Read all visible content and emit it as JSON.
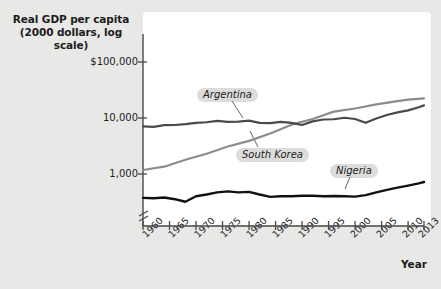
{
  "chart_data": {
    "type": "line",
    "title": "Real GDP per capita (2000 dollars, log scale)",
    "title_line1": "Real GDP per capita",
    "title_line2": "(2000 dollars, log scale)",
    "xlabel": "Year",
    "ylabel": "",
    "log_scale": true,
    "y_axis_break": true,
    "grid": false,
    "legend_position": "inline-callouts",
    "ytick_labels": [
      "$100,000",
      "10,000",
      "1,000"
    ],
    "ytick_values": [
      100000,
      10000,
      1000
    ],
    "ylim": [
      300,
      200000
    ],
    "xtick_labels": [
      "1960",
      "1965",
      "1970",
      "1975",
      "1980",
      "1985",
      "1990",
      "1995",
      "2000",
      "2005",
      "2010",
      "2013"
    ],
    "xtick_values": [
      1960,
      1965,
      1970,
      1975,
      1980,
      1985,
      1990,
      1995,
      2000,
      2005,
      2010,
      2013
    ],
    "xlim": [
      1960,
      2013
    ],
    "colors": {
      "argentina": "#4a4a4a",
      "south_korea": "#8c8c8c",
      "nigeria": "#111111",
      "panel": "#ffffff",
      "background": "#e8e8e6",
      "axis": "#4a4a4a",
      "callout_bg": "#dcdcda"
    },
    "series": [
      {
        "name": "Argentina",
        "color": "#4a4a4a",
        "label_x": 1978,
        "label_y": 22000,
        "x": [
          1960,
          1962,
          1964,
          1966,
          1968,
          1970,
          1972,
          1974,
          1976,
          1978,
          1980,
          1982,
          1984,
          1986,
          1988,
          1990,
          1992,
          1994,
          1996,
          1998,
          2000,
          2002,
          2004,
          2006,
          2008,
          2010,
          2012,
          2013
        ],
        "values": [
          7100,
          6950,
          7450,
          7500,
          7750,
          8200,
          8400,
          8900,
          8500,
          8600,
          9000,
          8200,
          8100,
          8500,
          8200,
          7500,
          8700,
          9400,
          9500,
          10100,
          9600,
          8200,
          9800,
          11300,
          12600,
          13700,
          15600,
          16800
        ]
      },
      {
        "name": "South Korea",
        "color": "#8c8c8c",
        "label_x": 1984,
        "label_y": 2600,
        "x": [
          1960,
          1964,
          1968,
          1972,
          1976,
          1980,
          1984,
          1988,
          1992,
          1996,
          2000,
          2004,
          2008,
          2010,
          2013
        ],
        "values": [
          1180,
          1350,
          1800,
          2300,
          3100,
          3900,
          5300,
          7600,
          9600,
          13000,
          14800,
          17500,
          20000,
          21300,
          22500
        ]
      },
      {
        "name": "Nigeria",
        "color": "#111111",
        "label_x": 2001,
        "label_y": 1700,
        "x": [
          1960,
          1962,
          1964,
          1966,
          1968,
          1970,
          1972,
          1974,
          1976,
          1978,
          1980,
          1982,
          1984,
          1986,
          1988,
          1990,
          1992,
          1994,
          1996,
          1998,
          2000,
          2002,
          2004,
          2006,
          2008,
          2010,
          2012,
          2013
        ],
        "values": [
          375,
          368,
          380,
          355,
          320,
          400,
          430,
          470,
          490,
          470,
          480,
          430,
          390,
          400,
          400,
          410,
          410,
          400,
          405,
          400,
          395,
          420,
          470,
          520,
          570,
          620,
          680,
          720
        ]
      }
    ]
  }
}
